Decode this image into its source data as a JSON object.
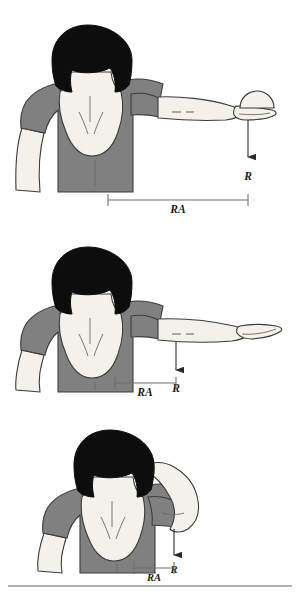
{
  "figure": {
    "title": "",
    "background_color": "#ffffff",
    "panels": [
      {
        "id": "panel-arm-horizontal-with-ball",
        "index": 1,
        "description": "Woman seen from behind with right arm abducted horizontally holding a ball in the palm",
        "force_label": "R",
        "moment_arm_label": "RA",
        "has_ball": true,
        "moment_arm_span_px": 140
      },
      {
        "id": "panel-arm-horizontal-no-ball",
        "index": 2,
        "description": "Woman seen from behind with right arm abducted horizontally, empty hand",
        "force_label": "R",
        "moment_arm_label": "RA",
        "has_ball": false,
        "moment_arm_span_px": 70
      },
      {
        "id": "panel-arm-flexed-behind-head",
        "index": 3,
        "description": "Woman seen from behind with right arm flexed, hand placed behind the head",
        "force_label": "R",
        "moment_arm_label": "RA",
        "has_ball": false,
        "moment_arm_span_px": 40
      }
    ],
    "colors": {
      "hair": "#0d0d0d",
      "shirt": "#808080",
      "skin": "#f2f1ea",
      "outline": "#3c3c3c",
      "measure_line": "#6e6e6e",
      "arrow": "#2b2b2b",
      "divider": "#9a9a9a"
    },
    "divider": {
      "label": "bottom-rule",
      "y": 586
    }
  }
}
